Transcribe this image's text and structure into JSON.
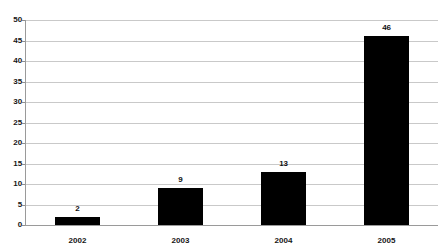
{
  "chart_data": {
    "type": "bar",
    "title": "",
    "subtitle": "",
    "xlabel": "",
    "ylabel": "",
    "categories": [
      "2002",
      "2003",
      "2004",
      "2005"
    ],
    "values": [
      2,
      9,
      13,
      46
    ],
    "data_labels": [
      "2",
      "9",
      "13",
      "46"
    ],
    "ylim": [
      0,
      50
    ],
    "ytick_step": 5,
    "yticks": [
      "0",
      "5",
      "10",
      "15",
      "20",
      "25",
      "30",
      "35",
      "40",
      "45",
      "50"
    ],
    "grid": "horizontal",
    "legend": "none",
    "series": [
      {
        "name": "",
        "values": [
          2,
          9,
          13,
          46
        ]
      }
    ],
    "colors": {
      "bar": "#000000",
      "gridline": "#c9c9c9",
      "axis": "#9a9a9a",
      "background": "#ffffff",
      "text": "#161616"
    }
  }
}
